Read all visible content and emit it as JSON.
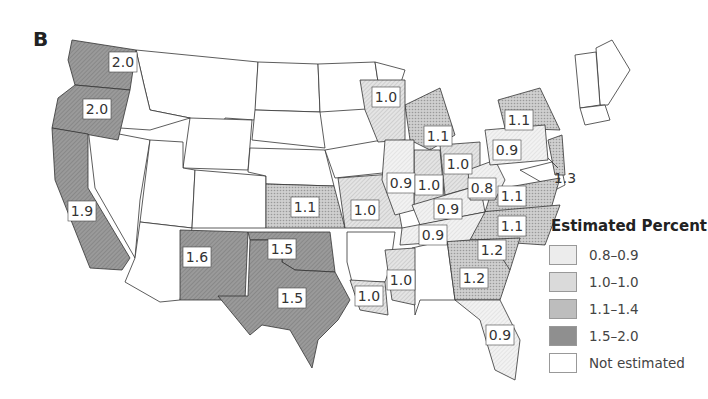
{
  "panel_letter": "B",
  "legend": {
    "title": "Estimated Percent",
    "items": [
      {
        "label": "0.8–0.9",
        "color": "#ececec"
      },
      {
        "label": "1.0–1.0",
        "color": "#dadada"
      },
      {
        "label": "1.1–1.4",
        "color": "#bdbdbd"
      },
      {
        "label": "1.5–2.0",
        "color": "#8f8f8f"
      },
      {
        "label": "Not estimated",
        "color": "#ffffff"
      }
    ]
  },
  "chart_data": {
    "type": "choropleth",
    "title": "Estimated Percent",
    "panel": "B",
    "bins": [
      "0.8–0.9",
      "1.0–1.0",
      "1.1–1.4",
      "1.5–2.0",
      "Not estimated"
    ],
    "values": {
      "Washington": 2.0,
      "Oregon": 2.0,
      "California": 1.9,
      "New Mexico": 1.6,
      "Texas": 1.5,
      "Oklahoma": 1.5,
      "Kansas": 1.1,
      "Missouri": 1.0,
      "Louisiana": 1.0,
      "Mississippi": 1.0,
      "Wisconsin": 1.0,
      "Illinois": 0.9,
      "Indiana": 1.0,
      "Michigan": 1.1,
      "Ohio": 1.0,
      "Kentucky": 0.9,
      "Tennessee": 0.9,
      "West Virginia": 0.8,
      "Virginia": 1.1,
      "North Carolina": 1.1,
      "South Carolina": 1.2,
      "Georgia": 1.2,
      "Florida": 0.9,
      "Pennsylvania": 0.9,
      "New York": 1.1,
      "New Jersey": 1.3
    },
    "not_estimated": [
      "Idaho",
      "Montana",
      "Wyoming",
      "Nevada",
      "Utah",
      "Arizona",
      "Colorado",
      "North Dakota",
      "South Dakota",
      "Nebraska",
      "Minnesota",
      "Iowa",
      "Arkansas",
      "Alabama",
      "Maryland",
      "Delaware",
      "Connecticut",
      "Rhode Island",
      "Massachusetts",
      "Vermont",
      "New Hampshire",
      "Maine"
    ]
  },
  "labels": [
    {
      "text": "2.0",
      "x": 123,
      "y": 62
    },
    {
      "text": "2.0",
      "x": 97,
      "y": 109
    },
    {
      "text": "1.9",
      "x": 82,
      "y": 211
    },
    {
      "text": "1.6",
      "x": 197,
      "y": 257
    },
    {
      "text": "1.5",
      "x": 282,
      "y": 249
    },
    {
      "text": "1.5",
      "x": 292,
      "y": 298
    },
    {
      "text": "1.1",
      "x": 305,
      "y": 207
    },
    {
      "text": "1.0",
      "x": 365,
      "y": 210
    },
    {
      "text": "1.0",
      "x": 369,
      "y": 296
    },
    {
      "text": "1.0",
      "x": 401,
      "y": 280
    },
    {
      "text": "1.0",
      "x": 386,
      "y": 97
    },
    {
      "text": "0.9",
      "x": 401,
      "y": 183
    },
    {
      "text": "1.0",
      "x": 429,
      "y": 185
    },
    {
      "text": "1.1",
      "x": 438,
      "y": 136
    },
    {
      "text": "1.0",
      "x": 458,
      "y": 164
    },
    {
      "text": "0.9",
      "x": 448,
      "y": 209
    },
    {
      "text": "0.8",
      "x": 482,
      "y": 188
    },
    {
      "text": "1.1",
      "x": 512,
      "y": 196
    },
    {
      "text": "1.1",
      "x": 512,
      "y": 226
    },
    {
      "text": "0.9",
      "x": 433,
      "y": 235
    },
    {
      "text": "1.2",
      "x": 492,
      "y": 250
    },
    {
      "text": "1.2",
      "x": 474,
      "y": 278
    },
    {
      "text": "0.9",
      "x": 500,
      "y": 335
    },
    {
      "text": "0.9",
      "x": 507,
      "y": 150
    },
    {
      "text": "1.1",
      "x": 519,
      "y": 120
    }
  ],
  "callout": {
    "text": "1.3",
    "x": 565,
    "y": 178
  }
}
